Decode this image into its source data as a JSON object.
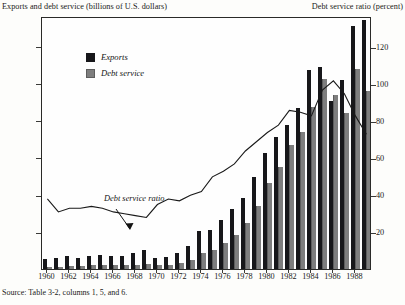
{
  "titles": {
    "left_axis": "Exports and debt service (billions of U.S. dollars)",
    "right_axis": "Debt service ratio (percent)"
  },
  "legend": {
    "items": [
      {
        "label": "Exports",
        "color": "#17171a",
        "key": "exports"
      },
      {
        "label": "Debt service",
        "color": "#7e7e7e",
        "key": "debt"
      }
    ]
  },
  "annotation": {
    "label": "Debt service ratio"
  },
  "source": {
    "note": "Source: Table 3-2, columns 1, 5, and 6."
  },
  "chart_data": {
    "type": "bar",
    "title": "",
    "subtitle": "",
    "xlabel": "",
    "ylabel": "Exports and debt service (billions of U.S. dollars)",
    "y2label": "Debt service ratio (percent)",
    "grid": false,
    "legend_position": "top-left",
    "ylim": [
      0,
      34
    ],
    "y2lim": [
      0,
      137
    ],
    "yticks": [
      5,
      10,
      15,
      20,
      25,
      30
    ],
    "y2ticks": [
      20,
      40,
      60,
      80,
      100,
      120
    ],
    "x": [
      1960,
      1961,
      1962,
      1963,
      1964,
      1965,
      1966,
      1967,
      1968,
      1969,
      1970,
      1971,
      1972,
      1973,
      1974,
      1975,
      1976,
      1977,
      1978,
      1979,
      1980,
      1981,
      1982,
      1983,
      1984,
      1985,
      1986,
      1987,
      1988,
      1989
    ],
    "xtick_labels": [
      "1960",
      "1962",
      "1964",
      "1966",
      "1968",
      "1970",
      "1972",
      "1974",
      "1976",
      "1978",
      "1980",
      "1982",
      "1984",
      "1986",
      "1988"
    ],
    "series": [
      {
        "name": "Exports",
        "type": "bar",
        "axis": "left",
        "color": "#17171a",
        "values": [
          1.3,
          1.5,
          1.7,
          1.5,
          1.7,
          1.9,
          1.8,
          1.8,
          2.2,
          2.6,
          1.5,
          1.6,
          2.1,
          3.1,
          5.1,
          5.3,
          6.6,
          8.0,
          9.6,
          12.4,
          15.6,
          17.7,
          19.4,
          21.6,
          26.7,
          27.2,
          22.6,
          25.4,
          32.6,
          33.5
        ]
      },
      {
        "name": "Debt service",
        "type": "bar",
        "axis": "left",
        "color": "#7e7e7e",
        "values": [
          0.3,
          0.3,
          0.4,
          0.4,
          0.5,
          0.5,
          0.5,
          0.5,
          0.6,
          0.7,
          0.5,
          0.6,
          0.8,
          1.2,
          2.1,
          2.6,
          3.5,
          4.6,
          6.2,
          8.5,
          11.5,
          13.7,
          16.6,
          18.4,
          21.8,
          25.6,
          23.4,
          21.0,
          26.9,
          23.9
        ]
      },
      {
        "name": "Debt service ratio",
        "type": "line",
        "axis": "right",
        "color": "#1a1a1a",
        "values": [
          39,
          32,
          34,
          34,
          35,
          34,
          32,
          31,
          30,
          29,
          36,
          39,
          38,
          41,
          43,
          51,
          54,
          58,
          65,
          70,
          75,
          79,
          87,
          86,
          84,
          98,
          103,
          96,
          84,
          74
        ]
      }
    ]
  }
}
